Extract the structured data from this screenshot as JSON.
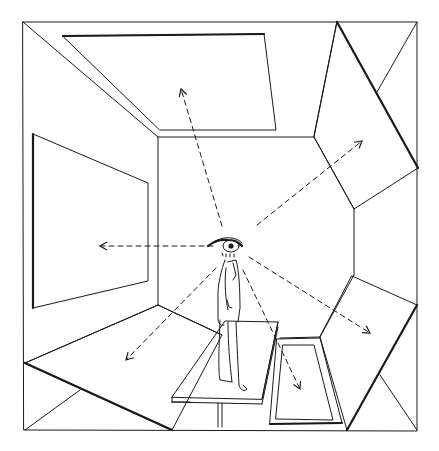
{
  "illustration": {
    "subject": "room-perception-sketch",
    "description": "Pen drawing of a man standing on a table inside a room, with dashed sight-line arrows radiating from a large eye at his head to the walls, ceiling and floor panels",
    "ink_color": "#1a1a1a",
    "paper_color": "#ffffff",
    "sight_lines": [
      {
        "direction": "ceiling"
      },
      {
        "direction": "upper-right"
      },
      {
        "direction": "left"
      },
      {
        "direction": "lower-left"
      },
      {
        "direction": "down"
      },
      {
        "direction": "lower-right"
      }
    ]
  }
}
